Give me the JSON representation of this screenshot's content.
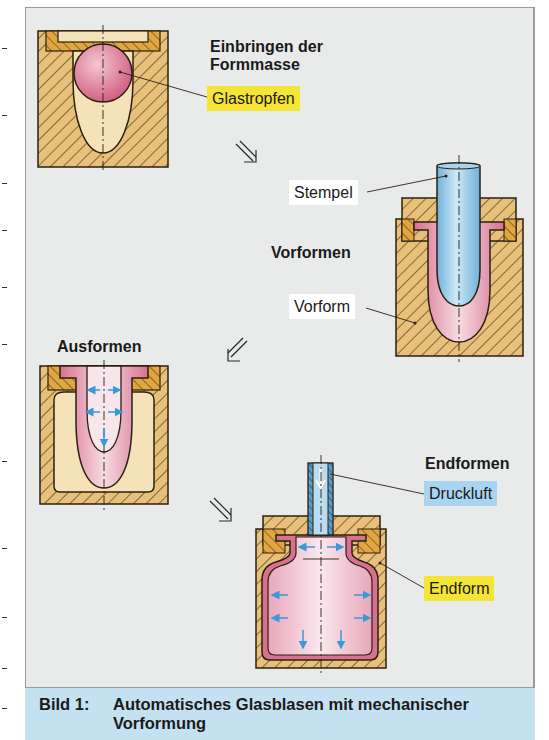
{
  "figure": {
    "steps": [
      {
        "id": "einbringen",
        "heading": "Einbringen der\nFormmasse",
        "heading_lines": [
          "Einbringen der",
          "Formmasse"
        ],
        "labels": [
          {
            "text": "Glastropfen",
            "style": "yellow"
          }
        ]
      },
      {
        "id": "vorformen",
        "heading": "Vorformen",
        "labels": [
          {
            "text": "Stempel",
            "style": "white"
          },
          {
            "text": "Vorform",
            "style": "white"
          }
        ]
      },
      {
        "id": "ausformen",
        "heading": "Ausformen",
        "labels": []
      },
      {
        "id": "endformen",
        "heading": "Endformen",
        "labels": [
          {
            "text": "Druckluft",
            "style": "blue"
          },
          {
            "text": "Endform",
            "style": "yellow"
          }
        ]
      }
    ],
    "flow_arrows": [
      "arrow-down-right",
      "arrow-down-left",
      "arrow-down-right"
    ],
    "colors": {
      "background": "#e9ebeb",
      "mold": "#e8c07a",
      "mold_insert": "#e2a640",
      "cavity": "#f6e2b8",
      "glass": "#d8708f",
      "plunger": "#8ec6e6",
      "pressure_arrow": "#3a9ad6",
      "label_yellow": "#f4e435",
      "label_blue": "#a9d4ef",
      "caption_bg": "#c4e1f1"
    }
  },
  "caption": {
    "number": "Bild 1:",
    "title": "Automatisches Glasblasen mit mechanischer Vorformung"
  }
}
